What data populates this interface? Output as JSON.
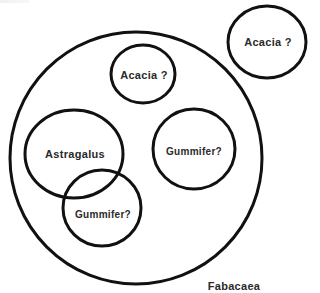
{
  "diagram": {
    "type": "euler-diagram",
    "stroke_color": "#111111",
    "text_color": "#2a2a2a",
    "background": "#ffffff",
    "outer_set": {
      "label": "Fabacaea",
      "cx": 136,
      "cy": 158,
      "rx": 126,
      "ry": 126
    },
    "sets": [
      {
        "id": "acacia-outside",
        "label": "Acacia ?",
        "cx": 267,
        "cy": 42,
        "rx": 39,
        "ry": 36,
        "inside_outer": false
      },
      {
        "id": "acacia-inside",
        "label": "Acacia ?",
        "cx": 143,
        "cy": 74,
        "rx": 32,
        "ry": 29,
        "inside_outer": true
      },
      {
        "id": "astragalus",
        "label": "Astragalus",
        "cx": 74,
        "cy": 154,
        "rx": 49,
        "ry": 44,
        "inside_outer": true
      },
      {
        "id": "gummifer-right",
        "label": "Gummifer?",
        "cx": 194,
        "cy": 149,
        "rx": 41,
        "ry": 40,
        "inside_outer": true
      },
      {
        "id": "gummifer-overlap",
        "label": "Gummifer?",
        "cx": 102,
        "cy": 208,
        "rx": 39,
        "ry": 38,
        "inside_outer": true
      }
    ],
    "labels": {
      "acacia_outside": "Acacia ?",
      "acacia_inside": "Acacia ?",
      "astragalus": "Astragalus",
      "gummifer_right": "Gummifer?",
      "gummifer_overlap": "Gummifer?",
      "fabacaea": "Fabacaea"
    }
  }
}
